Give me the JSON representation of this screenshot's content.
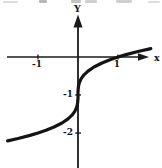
{
  "figure_title": "",
  "chart_data": {
    "type": "line",
    "title": "",
    "xlabel": "x",
    "ylabel": "Y",
    "xlim": [
      -1.9,
      2.1
    ],
    "ylim": [
      -2.95,
      1.15
    ],
    "grid": false,
    "legend": "none",
    "x_ticks": [
      {
        "value": -1,
        "label": "-1"
      },
      {
        "value": 1,
        "label": "1"
      }
    ],
    "y_ticks": [
      {
        "value": -1,
        "label": "-1"
      },
      {
        "value": -2,
        "label": "-2"
      }
    ],
    "series": [
      {
        "name": "y = x^(1/3) - 1",
        "stroke_color": "#141414",
        "stroke_width": 3.2,
        "points": [
          [
            -1.76,
            -2.207
          ],
          [
            -1.5,
            -2.145
          ],
          [
            -1.2,
            -2.063
          ],
          [
            -1.0,
            -2.0
          ],
          [
            -0.8,
            -1.928
          ],
          [
            -0.6,
            -1.843
          ],
          [
            -0.4,
            -1.737
          ],
          [
            -0.25,
            -1.63
          ],
          [
            -0.15,
            -1.531
          ],
          [
            -0.08,
            -1.431
          ],
          [
            -0.04,
            -1.342
          ],
          [
            -0.015,
            -1.247
          ],
          [
            -0.004,
            -1.159
          ],
          [
            -0.0005,
            -1.079
          ],
          [
            0.0,
            -1.0
          ],
          [
            0.0005,
            -0.921
          ],
          [
            0.004,
            -0.841
          ],
          [
            0.015,
            -0.753
          ],
          [
            0.04,
            -0.658
          ],
          [
            0.08,
            -0.569
          ],
          [
            0.15,
            -0.469
          ],
          [
            0.25,
            -0.37
          ],
          [
            0.4,
            -0.263
          ],
          [
            0.6,
            -0.157
          ],
          [
            0.8,
            -0.072
          ],
          [
            1.0,
            0.0
          ],
          [
            1.2,
            0.063
          ],
          [
            1.5,
            0.145
          ],
          [
            1.82,
            0.221
          ]
        ]
      }
    ],
    "plot_mapping": {
      "origin_px": [
        78,
        57
      ],
      "px_per_unit_x": 40,
      "px_per_unit_y": 38
    },
    "axis_color": "#1a1a1a"
  }
}
